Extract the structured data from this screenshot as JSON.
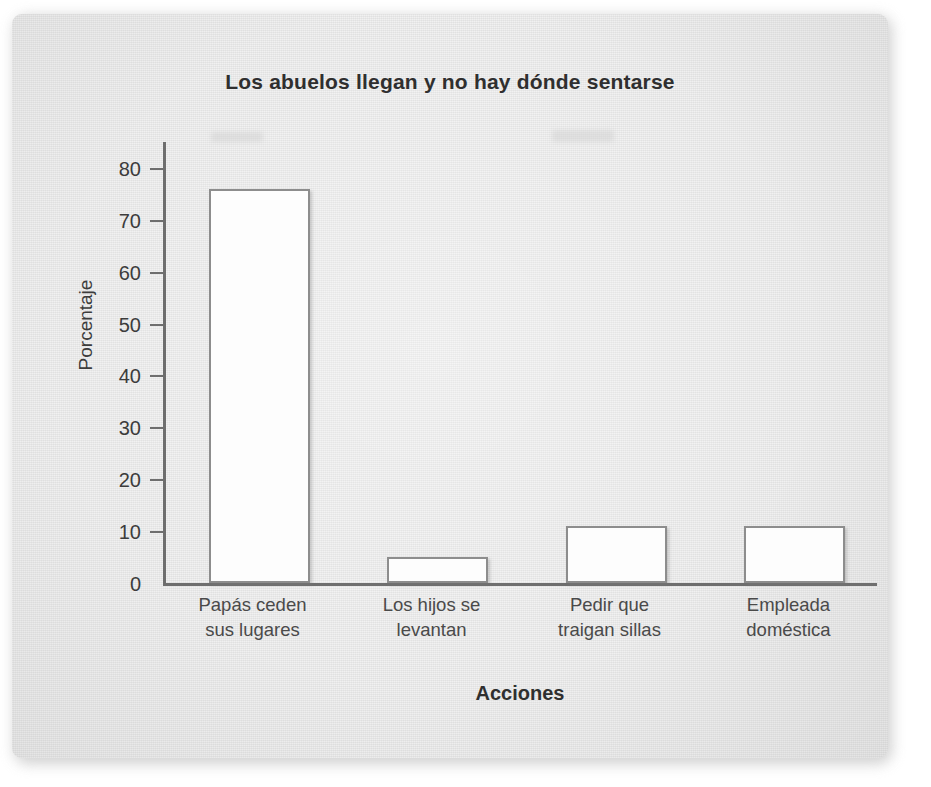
{
  "document": {
    "media": "scanned-page",
    "background_color": "#ffffff",
    "card_color": "#e3e3e3"
  },
  "chart_data": {
    "type": "bar",
    "title": "Los abuelos llegan y no hay dónde sentarse",
    "xlabel": "Acciones",
    "ylabel": "Porcentaje",
    "categories": [
      "Papás ceden sus lugares",
      "Los hijos se levantan",
      "Pedir que traigan sillas",
      "Empleada doméstica"
    ],
    "category_lines": [
      [
        "Papás ceden",
        "sus lugares"
      ],
      [
        "Los hijos se",
        "levantan"
      ],
      [
        "Pedir que",
        "traigan sillas"
      ],
      [
        "Empleada",
        "doméstica"
      ]
    ],
    "values": [
      76,
      5,
      11,
      11
    ],
    "ylim": [
      0,
      85
    ],
    "yticks": [
      0,
      10,
      20,
      30,
      40,
      50,
      60,
      70,
      80
    ],
    "ytick_labels": [
      "0",
      "10",
      "20",
      "30",
      "40",
      "50",
      "60",
      "70",
      "80"
    ],
    "grid": false,
    "legend": null,
    "bar_fill_color": "#fdfdfd",
    "bar_border_color": "#8d8d8d",
    "axis_color": "#6e6e6e",
    "text_color": "#3c3c3c",
    "title_color": "#2f2f2f"
  }
}
